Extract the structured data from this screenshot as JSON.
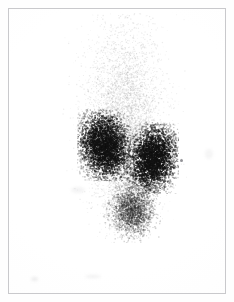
{
  "image": {
    "kind": "nuclear-medicine-scintigram",
    "modality_label": "Renal scintigraphy",
    "view_label": "Posterior",
    "caption": "",
    "background_color": "#ffffff",
    "film_color": "#fefefe",
    "frame_color": "#c9c9cc",
    "speckle_color": "#1a1a1a",
    "width": 234,
    "height": 302
  },
  "frame": {
    "left": 8,
    "top": 8,
    "width": 218,
    "height": 286,
    "border_width": 1
  },
  "regions": [
    {
      "name": "kidney-left",
      "label": "Left kidney",
      "center_x": 94,
      "center_y": 136,
      "radius_x": 19,
      "radius_y": 26,
      "rotation_deg": -12,
      "intensity": 1.0,
      "density": 3400,
      "dot_size": 1.35,
      "falloff": 1.15,
      "color": "#121212"
    },
    {
      "name": "kidney-right",
      "label": "Right kidney",
      "center_x": 142,
      "center_y": 149,
      "radius_x": 18,
      "radius_y": 25,
      "rotation_deg": 10,
      "intensity": 1.0,
      "density": 3300,
      "dot_size": 1.35,
      "falloff": 1.15,
      "color": "#121212"
    },
    {
      "name": "bladder",
      "label": "Bladder",
      "center_x": 122,
      "center_y": 200,
      "radius_x": 20,
      "radius_y": 24,
      "rotation_deg": 0,
      "intensity": 0.55,
      "density": 2300,
      "dot_size": 1.15,
      "falloff": 1.5,
      "color": "#2a2a2a"
    }
  ],
  "background_activity": {
    "name": "soft-tissue-background",
    "label": "Diffuse background activity",
    "center_x": 115,
    "center_y": 118,
    "radius_x": 44,
    "radius_y": 116,
    "density": 5200,
    "intensity": 0.3,
    "dot_size": 1.0,
    "falloff": 1.9,
    "color": "#3a3a3a"
  },
  "marker": {
    "name": "reference-marker",
    "label": "Reference marker",
    "x": 180,
    "y": 159,
    "size": 3,
    "color": "#6f6f74"
  },
  "artifacts": [
    {
      "name": "smudge-bottom-left",
      "label": "Film smudge"
    },
    {
      "name": "smudge-bottom-mid",
      "label": "Film smudge"
    },
    {
      "name": "smudge-mid-left",
      "label": "Film smudge"
    },
    {
      "name": "smudge-right-edge",
      "label": "Film smudge"
    }
  ],
  "chart_data": {
    "type": "heatmap",
    "title": "",
    "xlabel": "",
    "ylabel": "",
    "grid": false,
    "legend": "none",
    "xlim": [
      0,
      218
    ],
    "ylim": [
      0,
      286
    ],
    "hotspots": [
      {
        "label": "Left kidney",
        "x": 86,
        "y": 128,
        "relative_uptake": 1.0
      },
      {
        "label": "Right kidney",
        "x": 134,
        "y": 141,
        "relative_uptake": 0.98
      },
      {
        "label": "Bladder",
        "x": 114,
        "y": 192,
        "relative_uptake": 0.55
      }
    ]
  }
}
